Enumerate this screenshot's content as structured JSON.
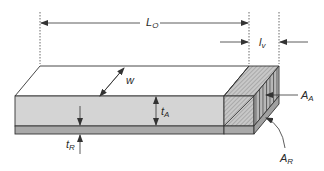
{
  "diagram": {
    "title": "",
    "type": "3D laminate strip with overlap region",
    "labels": {
      "total_length": {
        "main": "L",
        "sub": "O"
      },
      "overlap_length": {
        "main": "l",
        "sub": "v"
      },
      "width": {
        "main": "w",
        "sub": ""
      },
      "thickness_adherend": {
        "main": "t",
        "sub": "A"
      },
      "thickness_reinforcement": {
        "main": "t",
        "sub": "R"
      },
      "area_adherend": {
        "main": "A",
        "sub": "A"
      },
      "area_reinforcement": {
        "main": "A",
        "sub": "R"
      }
    },
    "colors": {
      "top_face": "#ffffff",
      "front_face_A": "#d4d4d4",
      "front_face_R": "#a9a9a9",
      "hatched_block": "#bdbdbd",
      "stroke": "#333333"
    }
  }
}
